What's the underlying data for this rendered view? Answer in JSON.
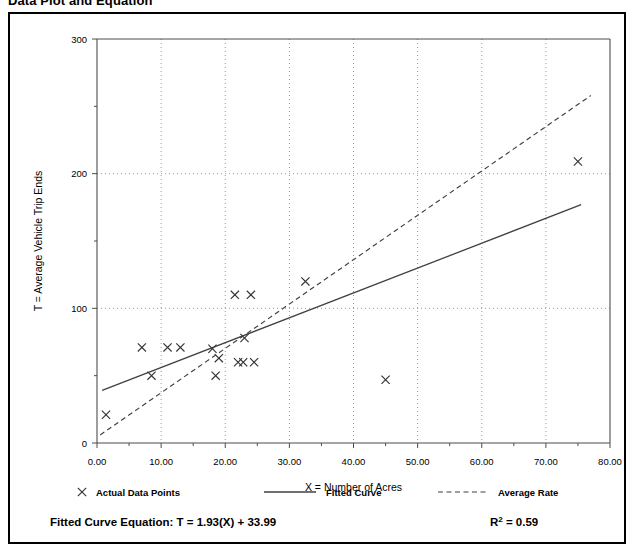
{
  "title": "Data Plot and Equation",
  "legend": [
    {
      "label": "Actual Data Points",
      "marker": "x-marker-icon"
    },
    {
      "label": "Fitted Curve",
      "marker": "solid-line-icon"
    },
    {
      "label": "Average Rate",
      "marker": "dashed-line-icon"
    }
  ],
  "equation": {
    "prefix": "Fitted Curve Equation:",
    "expression": "T = 1.93(X) + 33.99",
    "r2_base": "R",
    "r2_exp": "2",
    "r2_value": "= 0.59"
  },
  "colors": {
    "axis": "#4d4d4d",
    "grid": "#8c8c8c",
    "marker": "#333333",
    "line": "#404040",
    "frame": "#000000"
  },
  "chart_data": {
    "type": "scatter",
    "title": "Data Plot and Equation",
    "xlabel": "X = Number of Acres",
    "ylabel": "T = Average Vehicle Trip Ends",
    "xlim": [
      0,
      80
    ],
    "ylim": [
      0,
      300
    ],
    "xticks": [
      0,
      10,
      20,
      30,
      40,
      50,
      60,
      70,
      80
    ],
    "xticklabels": [
      "0.00",
      "10.00",
      "20.00",
      "30.00",
      "40.00",
      "50.00",
      "60.00",
      "70.00",
      "80.00"
    ],
    "xminorticks": [
      5,
      15,
      25,
      35,
      45,
      55,
      65,
      75
    ],
    "yticks": [
      0,
      100,
      200,
      300
    ],
    "yticklabels": [
      "0",
      "100",
      "200",
      "300"
    ],
    "yminorticks": [
      50,
      150,
      250
    ],
    "grid": true,
    "legend_position": "below-axes",
    "series": [
      {
        "name": "Actual Data Points",
        "type": "scatter",
        "marker": "x",
        "points": [
          [
            1.4,
            21
          ],
          [
            7.0,
            71
          ],
          [
            8.5,
            50
          ],
          [
            11.0,
            71
          ],
          [
            13.0,
            71
          ],
          [
            18.0,
            70
          ],
          [
            19.0,
            63
          ],
          [
            18.5,
            50
          ],
          [
            21.5,
            110
          ],
          [
            24.0,
            110
          ],
          [
            22.0,
            60
          ],
          [
            22.8,
            60
          ],
          [
            24.5,
            60
          ],
          [
            23.0,
            78
          ],
          [
            32.5,
            120
          ],
          [
            45.0,
            47
          ],
          [
            75.0,
            209
          ]
        ]
      },
      {
        "name": "Fitted Curve",
        "type": "line",
        "style": "solid",
        "equation": "T = 1.93(X) + 33.99",
        "slope": 1.93,
        "intercept": 33.99,
        "r_squared": 0.59,
        "x_range": [
          0.8,
          75.5
        ],
        "endpoints": [
          [
            0.8,
            39
          ],
          [
            75.5,
            177
          ]
        ]
      },
      {
        "name": "Average Rate",
        "type": "line",
        "style": "dashed",
        "x_range": [
          0.5,
          77.0
        ],
        "endpoints": [
          [
            0.5,
            6
          ],
          [
            77.0,
            258
          ]
        ]
      }
    ]
  }
}
